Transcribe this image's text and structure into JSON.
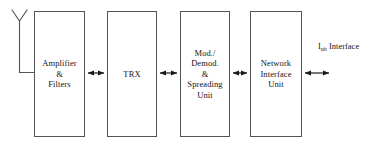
{
  "diagram": {
    "stroke_color": "#555555",
    "text_color": "#141414",
    "background": "#ffffff",
    "antenna": {
      "name": "antenna-symbol",
      "description": "Y-shaped antenna connected to Amplifier & Filters block"
    },
    "blocks": [
      {
        "id": "amplifier",
        "label": "Amplifier\n&\nFilters",
        "x": 34,
        "y": 11,
        "w": 51,
        "h": 126
      },
      {
        "id": "trx",
        "label": "TRX",
        "x": 107,
        "y": 11,
        "w": 50,
        "h": 126
      },
      {
        "id": "modem",
        "label": "Mod./\nDemod.\n&\nSpreading\nUnit",
        "x": 180,
        "y": 11,
        "w": 50,
        "h": 126
      },
      {
        "id": "niu",
        "label": "Network\nInterface\nUnit",
        "x": 250,
        "y": 11,
        "w": 52,
        "h": 126
      }
    ],
    "connectors": [
      {
        "id": "amplifier-trx",
        "type": "double-arrow",
        "from": "amplifier",
        "to": "trx",
        "x1": 87,
        "x2": 105,
        "y": 73
      },
      {
        "id": "trx-modem",
        "type": "double-arrow",
        "from": "trx",
        "to": "modem",
        "x1": 159,
        "x2": 178,
        "y": 73
      },
      {
        "id": "modem-niu",
        "type": "double-arrow",
        "from": "modem",
        "to": "niu",
        "x1": 232,
        "x2": 248,
        "y": 73
      },
      {
        "id": "niu-iub",
        "type": "double-arrow",
        "from": "niu",
        "to": "iub-interface",
        "x1": 304,
        "x2": 330,
        "y": 73
      }
    ],
    "interface_label": {
      "id": "iub-interface",
      "base": "I",
      "subscript": "ub",
      "suffix": " Interface",
      "full_text": "Iub Interface"
    }
  }
}
